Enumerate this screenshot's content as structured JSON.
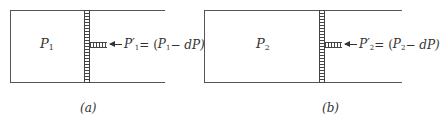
{
  "panels": [
    {
      "id": "a",
      "chamber_label": {
        "symbol": "P",
        "subscript": "1"
      },
      "equation": {
        "lhs_symbol": "P",
        "lhs_prime": "′",
        "lhs_subscript": "1",
        "rhs_open": " = (",
        "rhs_symbol": "P",
        "rhs_subscript": "1",
        "rhs_rest": " − dP)"
      },
      "caption": "(a)"
    },
    {
      "id": "b",
      "chamber_label": {
        "symbol": "P",
        "subscript": "2"
      },
      "equation": {
        "lhs_symbol": "P",
        "lhs_prime": "′",
        "lhs_subscript": "2",
        "rhs_open": " = (",
        "rhs_symbol": "P",
        "rhs_subscript": "2",
        "rhs_rest": " − dP)"
      },
      "caption": "(b)"
    }
  ]
}
